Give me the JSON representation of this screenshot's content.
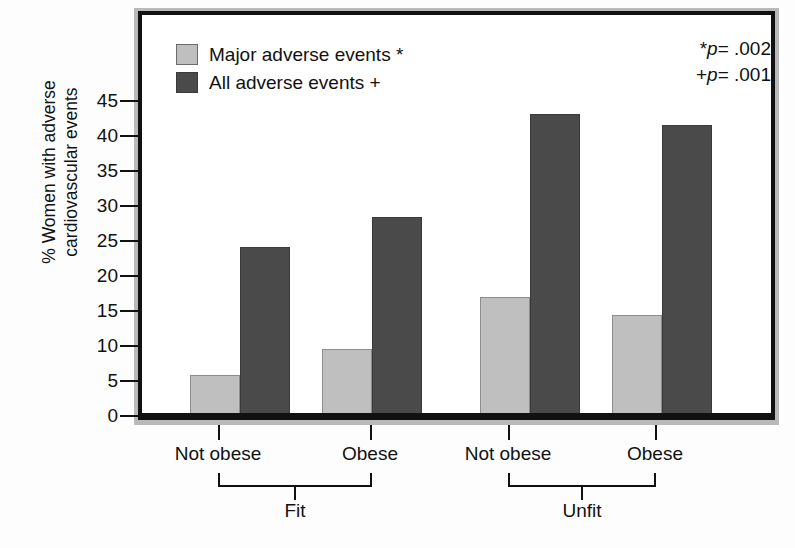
{
  "chart_data": {
    "type": "bar",
    "title": "",
    "xlabel": "",
    "ylabel": "% Women with adverse cardiovascular events",
    "ylabel_line1": "% Women with adverse",
    "ylabel_line2": "cardiovascular events",
    "ylim": [
      0,
      48
    ],
    "yticks": [
      0,
      5,
      10,
      15,
      20,
      25,
      30,
      35,
      40,
      45
    ],
    "ytick_labels": [
      "0",
      "5",
      "10",
      "15",
      "20",
      "25",
      "30",
      "35",
      "40",
      "45"
    ],
    "grid": false,
    "legend_position": "top-left",
    "categories": [
      "Not obese",
      "Obese",
      "Not obese",
      "Obese"
    ],
    "groups": [
      {
        "label": "Fit",
        "categories": [
          "Not obese",
          "Obese"
        ]
      },
      {
        "label": "Unfit",
        "categories": [
          "Not obese",
          "Obese"
        ]
      }
    ],
    "series": [
      {
        "name": "Major adverse events *",
        "color": "#bfbfbf",
        "values": [
          5.7,
          9.4,
          16.8,
          14.3
        ]
      },
      {
        "name": "All adverse events +",
        "color": "#4a4a4a",
        "values": [
          24.0,
          28.3,
          43.0,
          41.5
        ]
      }
    ],
    "annotations": [
      {
        "id": "p-star",
        "prefix": "*",
        "italic": "p",
        "text": "= .002"
      },
      {
        "id": "p-plus",
        "prefix": "+",
        "italic": "p",
        "text": "= .001"
      }
    ]
  },
  "legend": {
    "items": [
      {
        "label": "Major adverse events *",
        "color": "#bfbfbf"
      },
      {
        "label": "All adverse events +",
        "color": "#4a4a4a"
      }
    ]
  },
  "annotations": {
    "p_star_prefix": "*",
    "p_star_var": "p",
    "p_star_value": "= .002",
    "p_plus_prefix": "+",
    "p_plus_var": "p",
    "p_plus_value": "= .001"
  },
  "axes": {
    "y_title_line1": "% Women with adverse",
    "y_title_line2": "cardiovascular events",
    "y_labels": [
      "45",
      "40",
      "35",
      "30",
      "25",
      "20",
      "15",
      "10",
      "5",
      "0"
    ],
    "x_labels": [
      "Not obese",
      "Obese",
      "Not obese",
      "Obese"
    ],
    "group_labels": [
      "Fit",
      "Unfit"
    ]
  },
  "colors": {
    "bar_light": "#bfbfbf",
    "bar_dark": "#4a4a4a",
    "frame": "#111111",
    "frame_shadow": "#b9b9b9",
    "background": "#ffffff"
  }
}
